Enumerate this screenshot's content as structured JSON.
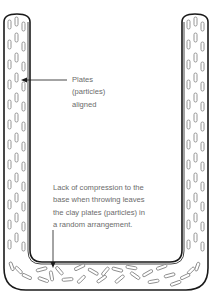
{
  "diagram": {
    "type": "cross-section",
    "colors": {
      "outline": "#1a1a1a",
      "particle": "#8a8a8a",
      "text": "#6b6b6b",
      "background": "#ffffff"
    },
    "annotations": [
      {
        "id": "aligned",
        "text": "Plates\n(particles)\naligned",
        "target": "left wall particles"
      },
      {
        "id": "random",
        "text": "Lack of compression to the\nbase when throwing leaves\nthe clay plates (particles) in\na random arrangement.",
        "target": "base particles"
      }
    ]
  }
}
